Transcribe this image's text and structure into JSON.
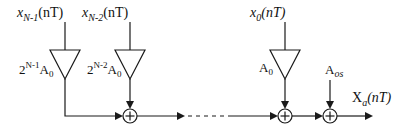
{
  "diagram": {
    "type": "block-diagram",
    "inputs": [
      {
        "id": "x_n_minus_1",
        "var": "x",
        "sub": "N-1",
        "arg": "(nT)"
      },
      {
        "id": "x_n_minus_2",
        "var": "x",
        "sub": "N-2",
        "arg": "(nT)"
      },
      {
        "id": "x_0",
        "var": "x",
        "sub": "0",
        "arg": "(nT)"
      }
    ],
    "gains": [
      {
        "id": "gain_n_minus_1",
        "base": "2",
        "exp": "N-1",
        "coef": "A",
        "coef_sub": "0"
      },
      {
        "id": "gain_n_minus_2",
        "base": "2",
        "exp": "N-2",
        "coef": "A",
        "coef_sub": "0"
      },
      {
        "id": "gain_0",
        "base": "",
        "exp": "",
        "coef": "A",
        "coef_sub": "0"
      }
    ],
    "summers": [
      {
        "id": "sum_1",
        "symbol": "+"
      },
      {
        "id": "sum_2",
        "symbol": "+"
      },
      {
        "id": "sum_offset",
        "symbol": "+"
      }
    ],
    "offset": {
      "var": "A",
      "sub": "os"
    },
    "output": {
      "var": "X",
      "sub": "a",
      "arg": "(nT)"
    },
    "continuation": "dashed"
  }
}
